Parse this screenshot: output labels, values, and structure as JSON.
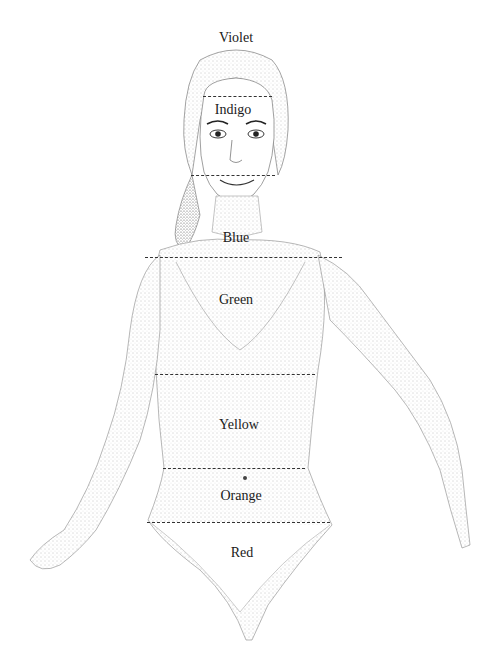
{
  "diagram": {
    "zones": [
      {
        "label": "Violet",
        "x": 236,
        "y": 30
      },
      {
        "label": "Indigo",
        "x": 233,
        "y": 102
      },
      {
        "label": "Blue",
        "x": 236,
        "y": 230
      },
      {
        "label": "Green",
        "x": 236,
        "y": 292
      },
      {
        "label": "Yellow",
        "x": 239,
        "y": 417
      },
      {
        "label": "Orange",
        "x": 241,
        "y": 488
      },
      {
        "label": "Red",
        "x": 242,
        "y": 545
      }
    ],
    "dividers": [
      {
        "name": "violet-indigo",
        "x1": 203,
        "x2": 272,
        "y": 96
      },
      {
        "name": "indigo-blue",
        "x1": 191,
        "x2": 275,
        "y": 175
      },
      {
        "name": "blue-green",
        "x1": 145,
        "x2": 342,
        "y": 257
      },
      {
        "name": "green-yellow",
        "x1": 155,
        "x2": 315,
        "y": 374
      },
      {
        "name": "yellow-orange",
        "x1": 163,
        "x2": 305,
        "y": 468
      },
      {
        "name": "orange-red",
        "x1": 147,
        "x2": 330,
        "y": 522
      }
    ],
    "line_color": "#333333",
    "text_color": "#1a1a1a"
  }
}
